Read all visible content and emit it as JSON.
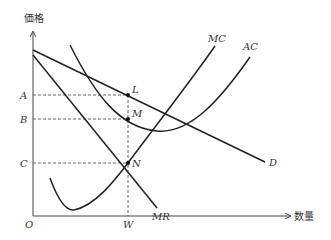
{
  "axes": {
    "y_label": "価格",
    "x_label": "数量",
    "origin_label": "O"
  },
  "price_levels": [
    {
      "label": "A",
      "point": "L"
    },
    {
      "label": "B",
      "point": "M"
    },
    {
      "label": "C",
      "point": "N"
    }
  ],
  "quantity_levels": [
    {
      "label": "W"
    }
  ],
  "points": {
    "L": "L",
    "M": "M",
    "N": "N"
  },
  "curves": {
    "MC": "MC",
    "AC": "AC",
    "D": "D",
    "MR": "MR"
  },
  "colors": {
    "line": "#222222",
    "axis": "#444444",
    "text": "#333333"
  }
}
